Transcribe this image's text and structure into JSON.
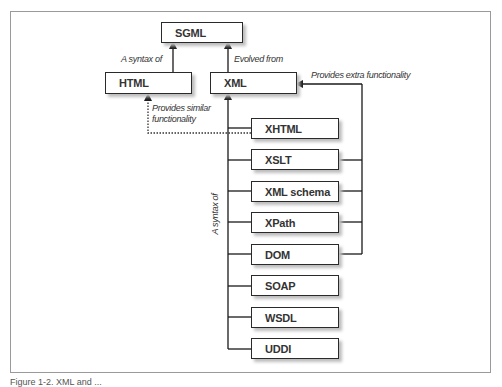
{
  "diagram": {
    "nodes": {
      "sgml": "SGML",
      "html": "HTML",
      "xml": "XML",
      "children": [
        "XHTML",
        "XSLT",
        "XML schema",
        "XPath",
        "DOM",
        "SOAP",
        "WSDL",
        "UDDI"
      ]
    },
    "edge_labels": {
      "html_to_sgml": "A syntax of",
      "xml_to_sgml": "Evolved from",
      "extra_functionality": "Provides extra functionality",
      "similar_functionality_line1": "Provides similar",
      "similar_functionality_line2": "functionality",
      "children_to_xml": "A syntax of"
    },
    "edges": [
      {
        "from": "HTML",
        "to": "SGML",
        "label": "A syntax of",
        "style": "solid"
      },
      {
        "from": "XML",
        "to": "SGML",
        "label": "Evolved from",
        "style": "solid"
      },
      {
        "from": "XHTML, XSLT, XML schema, XPath, DOM, SOAP, WSDL, UDDI",
        "to": "XML",
        "label": "A syntax of",
        "style": "solid"
      },
      {
        "from": "XSLT, XML schema, XPath, DOM",
        "to": "XML",
        "label": "Provides extra functionality",
        "style": "solid"
      },
      {
        "from": "XHTML",
        "to": "HTML",
        "label": "Provides similar functionality",
        "style": "dotted"
      }
    ]
  },
  "caption": "Figure 1-2. XML and ..."
}
